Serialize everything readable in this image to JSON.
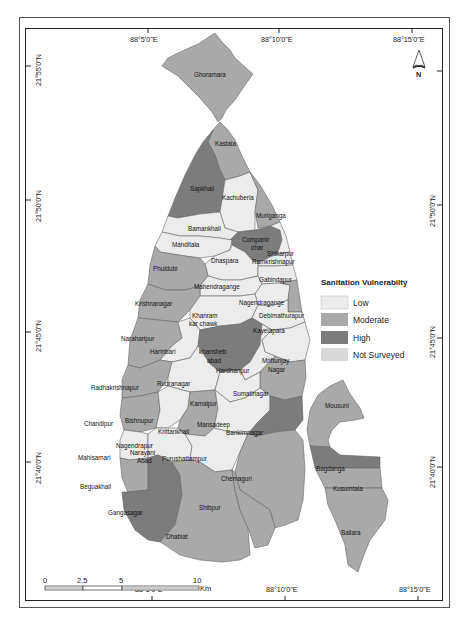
{
  "map": {
    "title": "Sanitation Vulnerability",
    "colors": {
      "low": "#ececec",
      "moderate": "#a9a9a9",
      "high": "#7c7c7c",
      "not_surveyed": "#d8d8d8",
      "border": "#555555"
    },
    "top_longitudes": [
      "88°5'0\"E",
      "88°10'0\"E",
      "88°15'0\"E"
    ],
    "bottom_longitudes": [
      "88°5'0\"E",
      "88°10'0\"E",
      "88°15'0\"E"
    ],
    "left_latitudes": [
      "21°55'0\"N",
      "21°50'0\"N",
      "21°45'0\"N",
      "21°40'0\"N"
    ],
    "right_latitudes": [
      "21°50'0\"N",
      "21°45'0\"N",
      "21°40'0\"N"
    ],
    "north_arrow": {
      "label": "N",
      "icon": "north-arrow-icon"
    },
    "legend": {
      "title": "Sanitation Vulnerabilty",
      "items": [
        {
          "label": "Low",
          "color": "#ececec"
        },
        {
          "label": "Moderate",
          "color": "#a9a9a9"
        },
        {
          "label": "High",
          "color": "#7c7c7c"
        },
        {
          "label": "Not Surveyed",
          "color": "#d8d8d8"
        }
      ]
    },
    "scale_bar": {
      "ticks": [
        "0",
        "2.5",
        "5",
        "10"
      ],
      "unit": "Km"
    },
    "regions": {
      "ghoramara": "Ghoramara",
      "kastala": "Kastala",
      "sapkhali": "Sapkhali",
      "kachuberia": "Kachuberia",
      "muriganga": "Muriganga",
      "bamankhali": "Bamankhali",
      "companir_char_1": "Companir",
      "companir_char_2": "char",
      "manditala": "Manditala",
      "shikarpur": "Shikarpur",
      "ramkrishnapur": "Ramkrishnapur",
      "dhaspara": "Dhaspara",
      "phuldubi": "Phuldubi",
      "gabindapur": "Gabindapur",
      "mahendragange": "Mahendragange",
      "nagendragange": "Nagendragange",
      "krishnanagar": "Krishnanagar",
      "debimathurapur": "Debimathurapur",
      "khanram_1": "Khanram",
      "khanram_2": "kar chawk",
      "kayelapara": "Kayelapara",
      "naraharipur": "Naraharipur",
      "harinbari": "Harinbari",
      "khansheb_1": "khansheb",
      "khansheb_2": "abad",
      "mrittunjay_1": "Mrittunjay",
      "mrittunjay_2": "Nagar",
      "hardhanpur": "Hardhanpur",
      "radhakrishnapur": "Radhakrishnapur",
      "rudranagar": "Rudranagar",
      "sumatinagar": "Sumatinagar",
      "kamalpur": "Kamalpur",
      "chandipur": "Chandipur",
      "bishnupur": "Bishnupur",
      "krittankhali": "Krittankhali",
      "mansadeep": "Mansadeep",
      "bankimnagar": "Bankimnagar",
      "nagendrapur": "Nagendrapur",
      "narayani_1": "Narayani",
      "narayani_2": "Abad",
      "mahisamari": "Mahisamari",
      "purushattampur": "Purushattampur",
      "beguakhali": "Beguakhali",
      "chemaguri": "Chemaguri",
      "gangasagar": "Gangasagar",
      "shibpur": "Shibpur",
      "dhablat": "Dhablat",
      "mousuni": "Mousuni",
      "bagdanga": "Bagdanga",
      "kusumtala": "Kusumtala",
      "baliara": "Baliara"
    }
  }
}
